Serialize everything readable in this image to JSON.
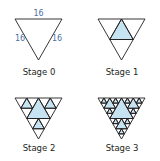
{
  "colors": {
    "stroke": "#231f20",
    "fill": "#c5e3f1",
    "dimension_text": "#4a6fa5",
    "label_text": "#231f20",
    "background": "#ffffff"
  },
  "stages": [
    {
      "label": "Stage 0",
      "level": 0,
      "triangle": {
        "left": [
          15,
          19
        ],
        "right": [
          62,
          19
        ],
        "bottom": [
          38.5,
          60
        ]
      },
      "label_pos": [
        39,
        75
      ]
    },
    {
      "label": "Stage 1",
      "level": 1,
      "triangle": {
        "left": [
          98,
          19
        ],
        "right": [
          145,
          19
        ],
        "bottom": [
          121.5,
          60
        ]
      },
      "label_pos": [
        122,
        75
      ]
    },
    {
      "label": "Stage 2",
      "level": 2,
      "triangle": {
        "left": [
          15,
          98
        ],
        "right": [
          62,
          98
        ],
        "bottom": [
          38.5,
          139
        ]
      },
      "label_pos": [
        39,
        151
      ]
    },
    {
      "label": "Stage 3",
      "level": 3,
      "triangle": {
        "left": [
          98,
          98
        ],
        "right": [
          145,
          98
        ],
        "bottom": [
          121.5,
          139
        ]
      },
      "label_pos": [
        122,
        151
      ]
    }
  ],
  "dimensions": [
    {
      "text": "16",
      "pos": [
        38.5,
        16
      ],
      "side": "top"
    },
    {
      "text": "16",
      "pos": [
        20,
        41
      ],
      "side": "left"
    },
    {
      "text": "16",
      "pos": [
        57,
        41
      ],
      "side": "right"
    }
  ]
}
